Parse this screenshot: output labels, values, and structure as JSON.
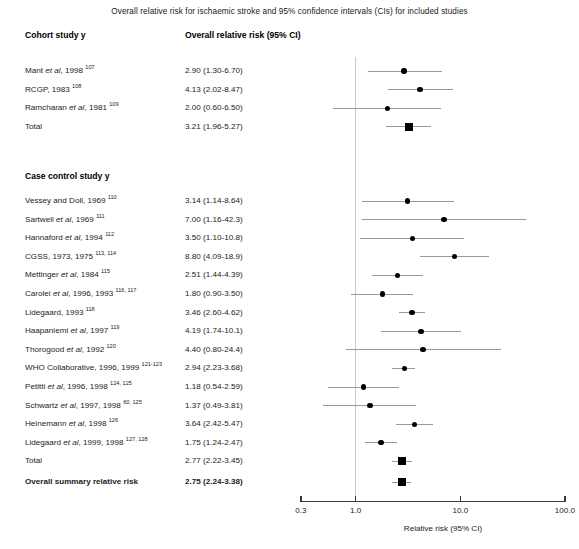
{
  "title": "Overall relative risk for ischaemic stroke and 95% confidence intervals (CIs) for included studies",
  "headers": {
    "left": "Cohort study y",
    "right": "Overall relative risk (95% CI)"
  },
  "sections": [
    {
      "name": "Case control study y"
    }
  ],
  "axis": {
    "label": "Relative risk (95% CI)",
    "ticks": [
      "0.3",
      "1.0",
      "10.0",
      "100.0"
    ],
    "tick_values": [
      0.3,
      1.0,
      10.0,
      100.0
    ],
    "scale": "log",
    "reference": 1.0,
    "xmin": 0.3,
    "xmax": 100.0
  },
  "chart_data": {
    "type": "forest",
    "title": "Overall relative risk for ischaemic stroke and 95% confidence intervals (CIs) for included studies",
    "xlabel": "Relative risk (95% CI)",
    "xscale": "log",
    "xlim": [
      0.3,
      100.0
    ],
    "xticks": [
      0.3,
      1.0,
      10.0,
      100.0
    ],
    "xticklabels": [
      "0.3",
      "1.0",
      "10.0",
      "100.0"
    ],
    "reference_line": 1.0,
    "groups": [
      {
        "name": "Cohort study y",
        "rows": [
          {
            "study": "Mant",
            "etal": true,
            "years": "1998",
            "refs": "107",
            "value": "2.90 (1.30-6.70)",
            "rr": 2.9,
            "lo": 1.3,
            "hi": 6.7,
            "marker": "circle"
          },
          {
            "study": "RCGP,",
            "etal": false,
            "years": "1983",
            "refs": "108",
            "value": "4.13 (2.02-8.47)",
            "rr": 4.13,
            "lo": 2.02,
            "hi": 8.47,
            "marker": "circle"
          },
          {
            "study": "Ramcharan",
            "etal": true,
            "years": "1981",
            "refs": "109",
            "value": "2.00 (0.60-6.50)",
            "rr": 2.0,
            "lo": 0.6,
            "hi": 6.5,
            "marker": "circle"
          },
          {
            "study": "Total",
            "etal": false,
            "years": "",
            "refs": "",
            "value": "3.21 (1.96-5.27)",
            "rr": 3.21,
            "lo": 1.96,
            "hi": 5.27,
            "marker": "square"
          }
        ]
      },
      {
        "name": "Case control study y",
        "rows": [
          {
            "study": "Vessey and Doll,",
            "etal": false,
            "years": "1969",
            "refs": "110",
            "value": "3.14 (1.14-8.64)",
            "rr": 3.14,
            "lo": 1.14,
            "hi": 8.64,
            "marker": "circle"
          },
          {
            "study": "Sartwell",
            "etal": true,
            "years": "1969",
            "refs": "111",
            "value": "7.00 (1.16-42.3)",
            "rr": 7.0,
            "lo": 1.16,
            "hi": 42.3,
            "marker": "circle"
          },
          {
            "study": "Hannaford",
            "etal": true,
            "years": "1994",
            "refs": "112",
            "value": "3.50 (1.10-10.8)",
            "rr": 3.5,
            "lo": 1.1,
            "hi": 10.8,
            "marker": "circle"
          },
          {
            "study": "CGSS,",
            "etal": false,
            "years": "1973, 1975",
            "refs": "113, 114",
            "value": "8.80 (4.09-18.9)",
            "rr": 8.8,
            "lo": 4.09,
            "hi": 18.9,
            "marker": "circle"
          },
          {
            "study": "Mettinger",
            "etal": true,
            "years": "1984",
            "refs": "115",
            "value": "2.51 (1.44-4.39)",
            "rr": 2.51,
            "lo": 1.44,
            "hi": 4.39,
            "marker": "circle"
          },
          {
            "study": "Carolei",
            "etal": true,
            "years": "1996, 1993",
            "refs": "116, 117",
            "value": "1.80 (0.90-3.50)",
            "rr": 1.8,
            "lo": 0.9,
            "hi": 3.5,
            "marker": "circle"
          },
          {
            "study": "Lidegaard,",
            "etal": false,
            "years": "1993",
            "refs": "118",
            "value": "3.46 (2.60-4.62)",
            "rr": 3.46,
            "lo": 2.6,
            "hi": 4.62,
            "marker": "circle"
          },
          {
            "study": "Haapaniemi",
            "etal": true,
            "years": "1997",
            "refs": "119",
            "value": "4.19 (1.74-10.1)",
            "rr": 4.19,
            "lo": 1.74,
            "hi": 10.1,
            "marker": "circle"
          },
          {
            "study": "Thorogood",
            "etal": true,
            "years": "1992",
            "refs": "120",
            "value": "4.40 (0.80-24.4)",
            "rr": 4.4,
            "lo": 0.8,
            "hi": 24.4,
            "marker": "circle"
          },
          {
            "study": "WHO Collaborative,",
            "etal": false,
            "years": "1996, 1999",
            "refs": "121-123",
            "value": "2.94 (2.23-3.68)",
            "rr": 2.94,
            "lo": 2.23,
            "hi": 3.68,
            "marker": "circle"
          },
          {
            "study": "Petitti",
            "etal": true,
            "years": "1996, 1998",
            "refs": "124, 125",
            "value": "1.18 (0.54-2.59)",
            "rr": 1.18,
            "lo": 0.54,
            "hi": 2.59,
            "marker": "circle"
          },
          {
            "study": "Schwartz",
            "etal": true,
            "years": "1997, 1998",
            "refs": "60, 125",
            "value": "1.37 (0.49-3.81)",
            "rr": 1.37,
            "lo": 0.49,
            "hi": 3.81,
            "marker": "circle"
          },
          {
            "study": "Heinemann",
            "etal": true,
            "years": "1998",
            "refs": "126",
            "value": "3.64 (2.42-5.47)",
            "rr": 3.64,
            "lo": 2.42,
            "hi": 5.47,
            "marker": "circle"
          },
          {
            "study": "Lidegaard",
            "etal": true,
            "years": "1999, 1998",
            "refs": "127, 128",
            "value": "1.75 (1.24-2.47)",
            "rr": 1.75,
            "lo": 1.24,
            "hi": 2.47,
            "marker": "circle"
          },
          {
            "study": "Total",
            "etal": false,
            "years": "",
            "refs": "",
            "value": "2.77 (2.22-3.45)",
            "rr": 2.77,
            "lo": 2.22,
            "hi": 3.45,
            "marker": "square"
          }
        ]
      },
      {
        "name": "",
        "rows": [
          {
            "study": "Overall summary relative risk",
            "etal": false,
            "years": "",
            "refs": "",
            "value": "2.75 (2.24-3.38)",
            "rr": 2.75,
            "lo": 2.24,
            "hi": 3.38,
            "marker": "square",
            "bold": true
          }
        ]
      }
    ]
  }
}
